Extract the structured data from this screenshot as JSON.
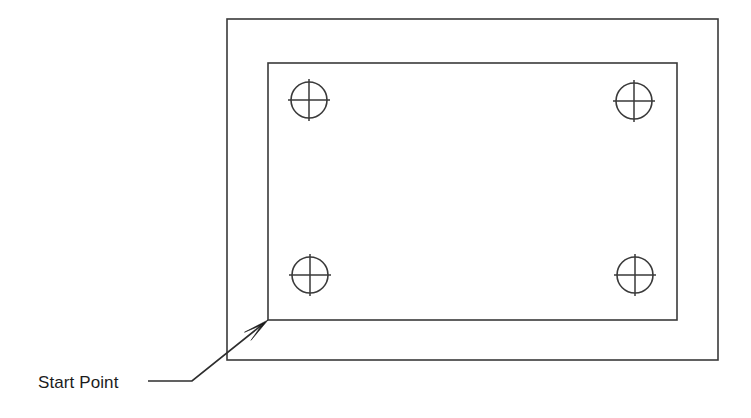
{
  "diagram": {
    "title": "Start Point",
    "background_color": "#ffffff",
    "line_color": "#3a3a3a",
    "text_color": "#1c1c1c",
    "canvas": {
      "width": 751,
      "height": 418
    },
    "annotation": {
      "label": "Start Point",
      "label_x": 38,
      "label_baseline_y": 388,
      "leader_horizontal_start_x": 148,
      "leader_horizontal_end_x": 192,
      "leader_horizontal_y": 381,
      "leader_diagonal_end_x": 268,
      "leader_diagonal_end_y": 320,
      "arrow_tip_x": 268,
      "arrow_tip_y": 320,
      "arrow_points_to": "inner-rectangle-bottom-left-corner"
    },
    "outer_rectangle": {
      "name": "outer-rectangle",
      "x": 227,
      "y": 19,
      "width": 491,
      "height": 341
    },
    "inner_rectangle": {
      "name": "inner-rectangle",
      "x": 268,
      "y": 63,
      "width": 409,
      "height": 257
    },
    "fasteners": [
      {
        "name": "fastener-top-left",
        "cx": 309,
        "cy": 100,
        "r": 18,
        "cross_overhang": 3
      },
      {
        "name": "fastener-top-right",
        "cx": 634,
        "cy": 101,
        "r": 18,
        "cross_overhang": 3
      },
      {
        "name": "fastener-bottom-left",
        "cx": 310,
        "cy": 275,
        "r": 18,
        "cross_overhang": 3
      },
      {
        "name": "fastener-bottom-right",
        "cx": 635,
        "cy": 275,
        "r": 18,
        "cross_overhang": 3
      }
    ]
  }
}
